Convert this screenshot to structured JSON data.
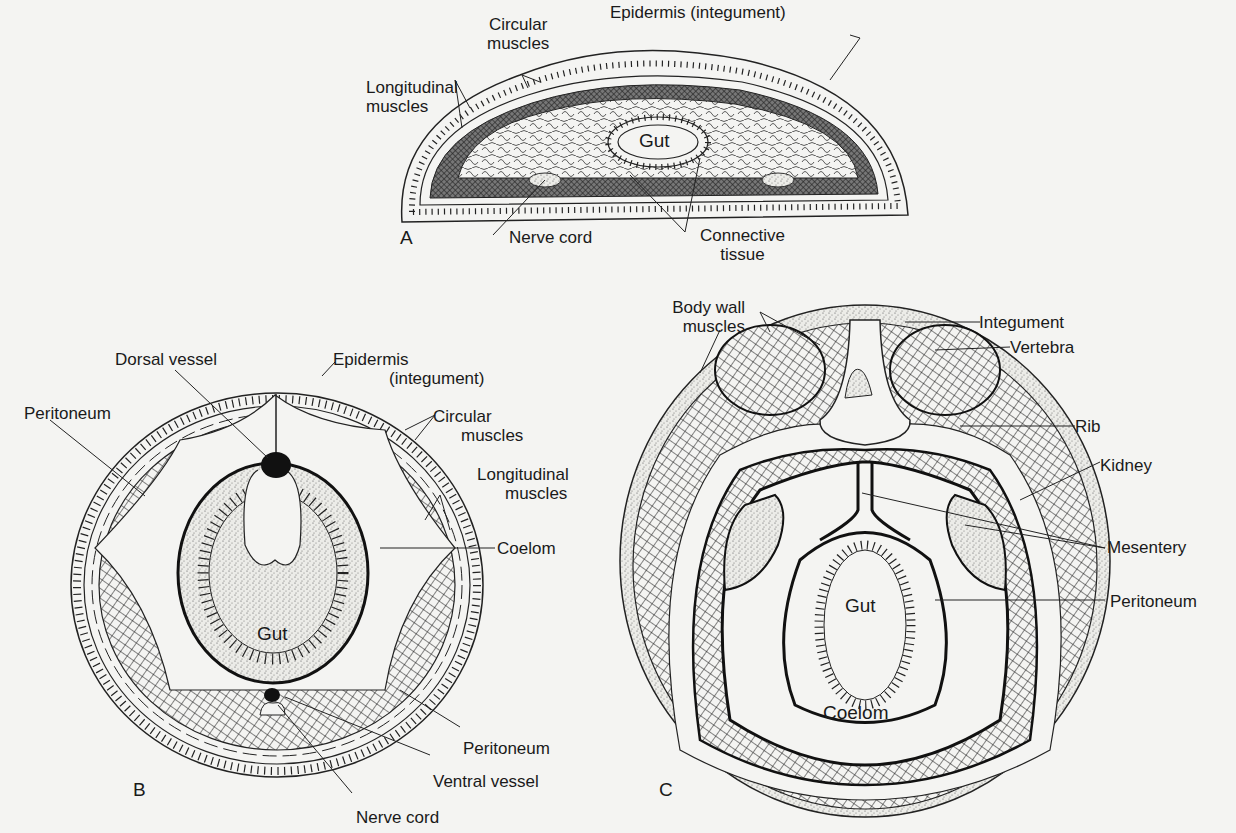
{
  "figure": {
    "panels": [
      {
        "id": "A",
        "label": "A",
        "description": "Acoelomate cross-section (flattened oval)",
        "structures": {
          "gut": "Gut",
          "circular_muscles": [
            "Circular",
            "muscles"
          ],
          "epidermis": "Epidermis (integument)",
          "longitudinal_muscles": [
            "Longitudinal",
            "muscles"
          ],
          "nerve_cord": "Nerve cord",
          "connective_tissue": [
            "Connective",
            "tissue"
          ]
        }
      },
      {
        "id": "B",
        "label": "B",
        "description": "Coelomate invertebrate cross-section (circle)",
        "structures": {
          "dorsal_vessel": "Dorsal vessel",
          "epidermis": [
            "Epidermis",
            "(integument)"
          ],
          "peritoneum_top": "Peritoneum",
          "circular_muscles": [
            "Circular",
            "muscles"
          ],
          "longitudinal_muscles": [
            "Longitudinal",
            "muscles"
          ],
          "coelom": "Coelom",
          "gut": "Gut",
          "peritoneum_bottom": "Peritoneum",
          "ventral_vessel": "Ventral vessel",
          "nerve_cord": "Nerve cord"
        }
      },
      {
        "id": "C",
        "label": "C",
        "description": "Vertebrate cross-section (oval)",
        "structures": {
          "body_wall_muscles": [
            "Body wall",
            "muscles"
          ],
          "integument": "Integument",
          "vertebra": "Vertebra",
          "rib": "Rib",
          "kidney": "Kidney",
          "mesentery": "Mesentery",
          "gut": "Gut",
          "peritoneum": "Peritoneum",
          "coelom": "Coelom"
        }
      }
    ],
    "colors": {
      "ink": "#1a1a1a",
      "paper": "#f4f4f2",
      "muscle_dark": "#3a3a3a"
    }
  }
}
